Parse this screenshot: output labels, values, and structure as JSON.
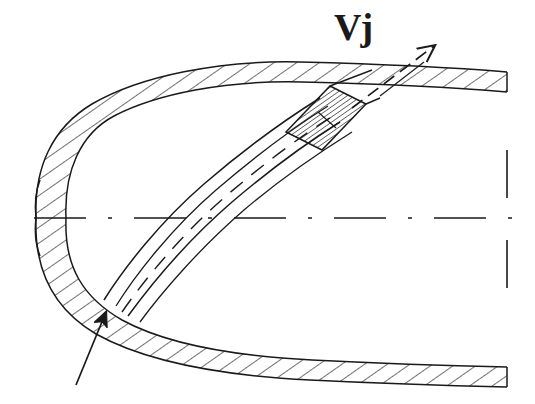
{
  "figure": {
    "domain": "Diagram",
    "kind": "engineering-cross-section",
    "width": 535,
    "height": 404,
    "background_color": "#ffffff",
    "line_color": "#1a1a1a",
    "hatch_color": "#1a1a1a"
  },
  "labels": {
    "jet_velocity": "Vj"
  },
  "annotations": [
    {
      "name": "jet-velocity-arrow",
      "label": "Vj",
      "meaning": "jet exit velocity vector",
      "direction": "up-right",
      "angle_deg": 28
    },
    {
      "name": "inflow-arrow",
      "label": "",
      "meaning": "incoming flow toward lower wall",
      "direction": "up-right",
      "angle_deg": 70
    }
  ],
  "geometry": {
    "centerline": {
      "name": "horizontal-centerline",
      "style": "dash-dot",
      "y": 218,
      "x_start": 34,
      "x_end": 527
    },
    "break_line": {
      "name": "vertical-break-line",
      "style": "dashed",
      "x": 507,
      "y_top": 57,
      "y_bottom": 373
    },
    "outer_wall_upper": {
      "name": "upper-wall",
      "hatched": true,
      "hatch_angle_deg": 55
    },
    "outer_wall_lower": {
      "name": "lower-wall",
      "hatched": true,
      "hatch_angle_deg": 55
    },
    "nose": {
      "name": "leading-edge-nose",
      "shape": "rounded",
      "x": 36,
      "y": 218
    },
    "jet_duct": {
      "name": "internal-jet-duct",
      "has_centerline": true,
      "centerline_style": "dashed",
      "exit_location": "upper-wall",
      "exit_hatched": true
    }
  },
  "colors": {
    "ink": "#1a1a1a",
    "paper": "#ffffff"
  }
}
